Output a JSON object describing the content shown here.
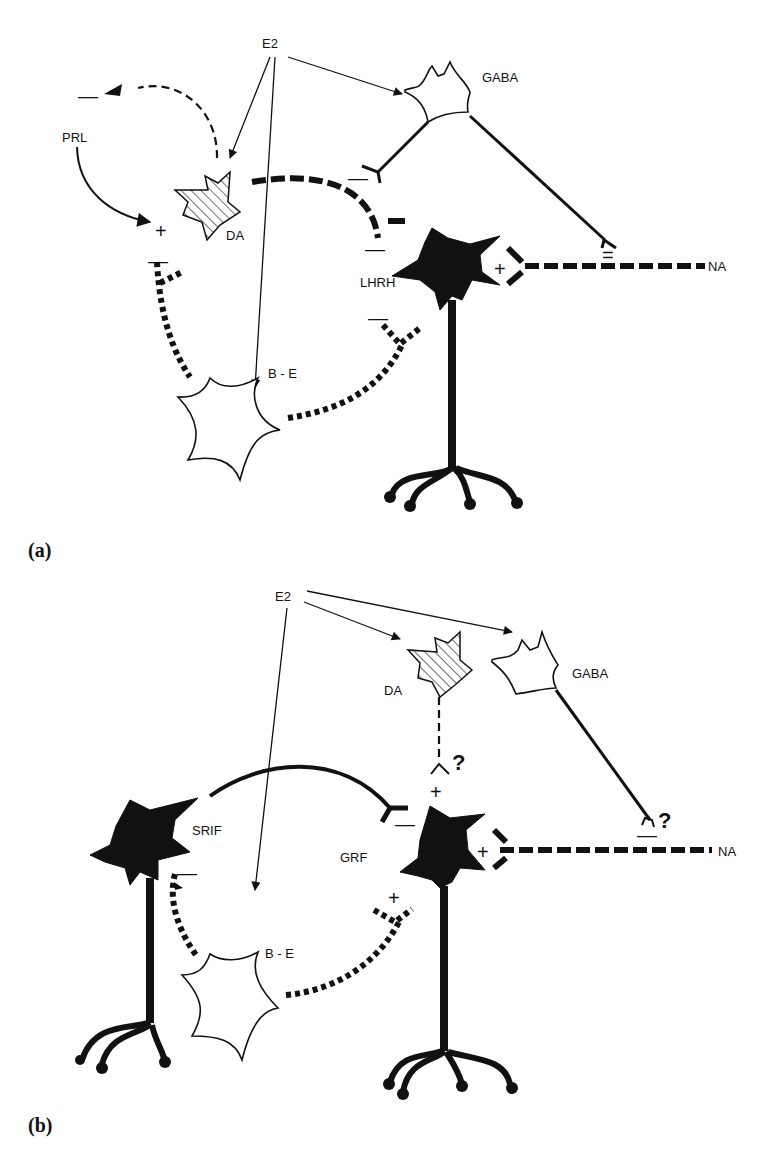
{
  "figure": {
    "panels": [
      {
        "id": "a",
        "label": "(a)",
        "source": "E2",
        "neurons": {
          "da": "DA",
          "gaba": "GABA",
          "lhrh": "LHRH",
          "be": "B - E",
          "prl": "PRL",
          "na": "NA"
        },
        "signs": {
          "prl_inhibit": "—",
          "prl_stim": "+",
          "da_be": "—",
          "da_lhrh": "—",
          "gaba_da": "—",
          "be_lhrh": "—",
          "gaba_na": "=",
          "na_lhrh": "+"
        }
      },
      {
        "id": "b",
        "label": "(b)",
        "source": "E2",
        "neurons": {
          "da": "DA",
          "gaba": "GABA",
          "srif": "SRIF",
          "grf": "GRF",
          "be": "B - E",
          "na": "NA"
        },
        "signs": {
          "da_grf": "+",
          "da_question": "?",
          "srif_grf": "—",
          "be_srif": "—",
          "be_grf": "+",
          "gaba_na": "—",
          "gaba_question": "?",
          "na_grf": "+"
        }
      }
    ]
  }
}
